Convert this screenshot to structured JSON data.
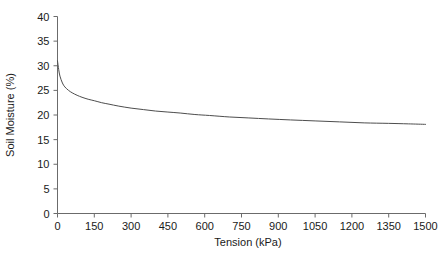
{
  "chart_data": {
    "type": "line",
    "title": "",
    "subtitle": "",
    "xlabel": "Tension (kPa)",
    "ylabel": "Soil Moisture (%)",
    "xlim": [
      0,
      1500
    ],
    "ylim": [
      0,
      40
    ],
    "xticks": [
      0,
      150,
      300,
      450,
      600,
      750,
      900,
      1050,
      1200,
      1350,
      1500
    ],
    "xtick_labels": [
      "0",
      "150",
      "300",
      "450",
      "600",
      "750",
      "900",
      "1050",
      "1200",
      "1350",
      "1500"
    ],
    "yticks": [
      0,
      5,
      10,
      15,
      20,
      25,
      30,
      35,
      40
    ],
    "ytick_labels": [
      "0",
      "5",
      "10",
      "15",
      "20",
      "25",
      "30",
      "35",
      "40"
    ],
    "grid": false,
    "legend": null,
    "legend_position": "none",
    "line_color": "#4d4d4d",
    "line_width": 1,
    "axis_color": "#6b6b6b",
    "background": "#ffffff",
    "annotations": [],
    "series": [
      {
        "name": "Soil moisture retention curve",
        "x": [
          0,
          5,
          10,
          20,
          30,
          45,
          60,
          80,
          100,
          125,
          150,
          180,
          210,
          250,
          300,
          350,
          400,
          450,
          500,
          560,
          620,
          700,
          780,
          860,
          950,
          1050,
          1150,
          1250,
          1350,
          1430,
          1500
        ],
        "y": [
          31.0,
          29.2,
          27.9,
          26.5,
          25.7,
          25.0,
          24.5,
          24.0,
          23.6,
          23.2,
          22.9,
          22.5,
          22.2,
          21.8,
          21.4,
          21.1,
          20.8,
          20.6,
          20.4,
          20.1,
          19.9,
          19.6,
          19.4,
          19.2,
          19.0,
          18.8,
          18.6,
          18.4,
          18.3,
          18.2,
          18.1
        ]
      }
    ]
  }
}
